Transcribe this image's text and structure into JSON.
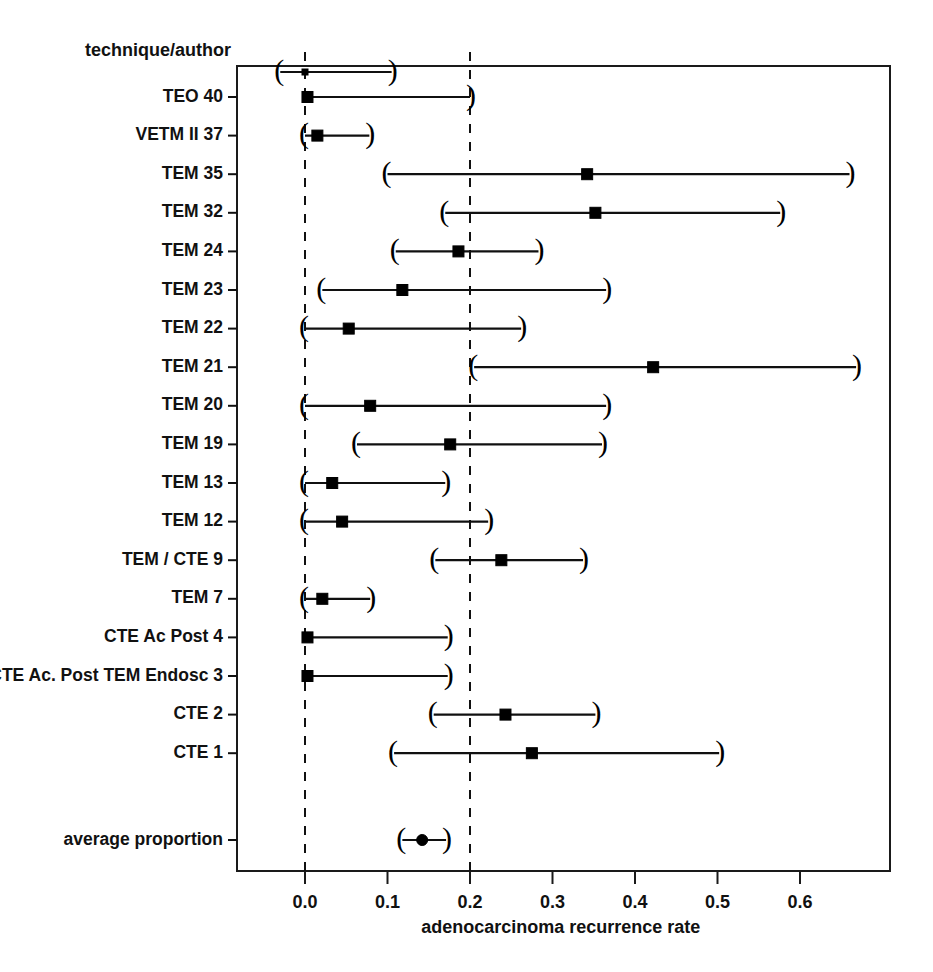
{
  "chart_data": {
    "type": "scatter",
    "subtype": "forest-plot",
    "title": "",
    "xlabel": "adenocarcinoma recurrence rate",
    "ylabel": "",
    "row_header": "technique/author",
    "xlim": [
      -0.02,
      0.7
    ],
    "xticks": [
      0.0,
      0.1,
      0.2,
      0.3,
      0.4,
      0.5,
      0.6
    ],
    "xticklabels": [
      "0.0",
      "0.1",
      "0.2",
      "0.3",
      "0.4",
      "0.5",
      "0.6"
    ],
    "grid": false,
    "legend": "none",
    "reference_lines": [
      {
        "name": "zero-reference",
        "value": 0.0,
        "style": "dashed"
      },
      {
        "name": "pooled-reference",
        "value": 0.2,
        "style": "dashed"
      }
    ],
    "categories": [
      "TEO 40",
      "VETM II 37",
      "TEM 35",
      "TEM 32",
      "TEM 24",
      "TEM 23",
      "TEM 22",
      "TEM 21",
      "TEM 20",
      "TEM 19",
      "TEM 13",
      "TEM 12",
      "TEM / CTE 9",
      "TEM 7",
      "CTE Ac Post 4",
      "CTE Ac. Post TEM Endosc 3",
      "CTE 2",
      "CTE 1",
      "average proportion"
    ],
    "rows": [
      {
        "label": "TEO 40",
        "estimate": 0.003,
        "ci_low": 0.0,
        "ci_high": 0.2,
        "marker": "square",
        "cap_low": false,
        "cap_high": true
      },
      {
        "label": "VETM II 37",
        "estimate": 0.015,
        "ci_low": 0.0,
        "ci_high": 0.078,
        "marker": "square",
        "cap_low": true,
        "cap_high": true
      },
      {
        "label": "TEM 35",
        "estimate": 0.342,
        "ci_low": 0.1,
        "ci_high": 0.66,
        "marker": "square",
        "cap_low": true,
        "cap_high": true
      },
      {
        "label": "TEM 32",
        "estimate": 0.352,
        "ci_low": 0.17,
        "ci_high": 0.576,
        "marker": "square",
        "cap_low": true,
        "cap_high": true
      },
      {
        "label": "TEM 24",
        "estimate": 0.186,
        "ci_low": 0.11,
        "ci_high": 0.283,
        "marker": "square",
        "cap_low": true,
        "cap_high": true
      },
      {
        "label": "TEM 23",
        "estimate": 0.118,
        "ci_low": 0.021,
        "ci_high": 0.365,
        "marker": "square",
        "cap_low": true,
        "cap_high": true
      },
      {
        "label": "TEM 22",
        "estimate": 0.053,
        "ci_low": 0.0,
        "ci_high": 0.262,
        "marker": "square",
        "cap_low": true,
        "cap_high": true
      },
      {
        "label": "TEM 21",
        "estimate": 0.422,
        "ci_low": 0.205,
        "ci_high": 0.668,
        "marker": "square",
        "cap_low": true,
        "cap_high": true
      },
      {
        "label": "TEM 20",
        "estimate": 0.079,
        "ci_low": 0.0,
        "ci_high": 0.365,
        "marker": "square",
        "cap_low": true,
        "cap_high": true
      },
      {
        "label": "TEM 19",
        "estimate": 0.176,
        "ci_low": 0.063,
        "ci_high": 0.36,
        "marker": "square",
        "cap_low": true,
        "cap_high": true
      },
      {
        "label": "TEM 13",
        "estimate": 0.033,
        "ci_low": 0.0,
        "ci_high": 0.17,
        "marker": "square",
        "cap_low": true,
        "cap_high": true
      },
      {
        "label": "TEM 12",
        "estimate": 0.045,
        "ci_low": 0.0,
        "ci_high": 0.222,
        "marker": "square",
        "cap_low": true,
        "cap_high": true
      },
      {
        "label": "TEM / CTE 9",
        "estimate": 0.238,
        "ci_low": 0.158,
        "ci_high": 0.337,
        "marker": "square",
        "cap_low": true,
        "cap_high": true
      },
      {
        "label": "TEM 7",
        "estimate": 0.021,
        "ci_low": 0.0,
        "ci_high": 0.079,
        "marker": "square",
        "cap_low": true,
        "cap_high": true
      },
      {
        "label": "CTE Ac Post 4",
        "estimate": 0.003,
        "ci_low": 0.0,
        "ci_high": 0.173,
        "marker": "square",
        "cap_low": false,
        "cap_high": true
      },
      {
        "label": "CTE Ac. Post TEM Endosc 3",
        "estimate": 0.003,
        "ci_low": 0.0,
        "ci_high": 0.173,
        "marker": "square",
        "cap_low": false,
        "cap_high": true
      },
      {
        "label": "CTE 2",
        "estimate": 0.243,
        "ci_low": 0.156,
        "ci_high": 0.352,
        "marker": "square",
        "cap_low": true,
        "cap_high": true
      },
      {
        "label": "CTE 1",
        "estimate": 0.275,
        "ci_low": 0.108,
        "ci_high": 0.502,
        "marker": "square",
        "cap_low": true,
        "cap_high": true
      },
      {
        "label": "average proportion",
        "estimate": 0.142,
        "ci_low": 0.118,
        "ci_high": 0.171,
        "marker": "circle",
        "cap_low": true,
        "cap_high": true
      }
    ],
    "header_row": {
      "label": "technique/author",
      "estimate": 0.0,
      "ci_low": -0.03,
      "ci_high": 0.105,
      "marker": "square-small",
      "cap_low": true,
      "cap_high": true
    },
    "colors": {
      "line": "#101010",
      "marker": "#000000",
      "reference": "#111111",
      "axis": "#1a1a1a",
      "background": "#ffffff"
    }
  }
}
